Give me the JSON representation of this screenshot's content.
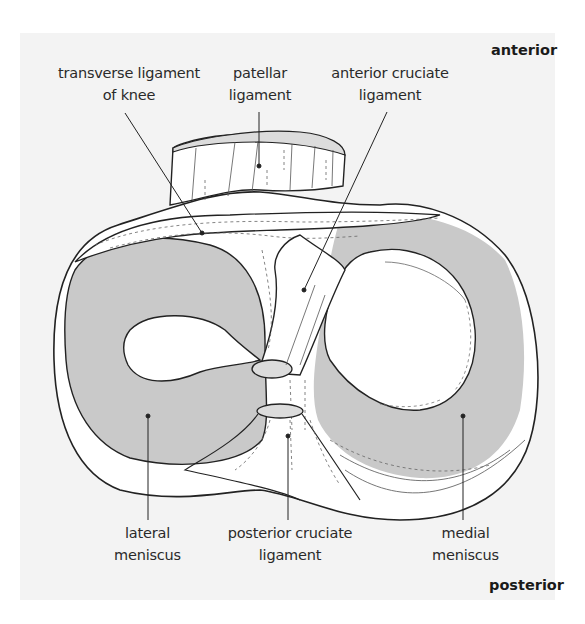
{
  "figure": {
    "orientation": {
      "top": "anterior",
      "bottom": "posterior"
    },
    "labels": {
      "transverse_ligament": {
        "line1": "transverse ligament",
        "line2": "of knee"
      },
      "patellar_ligament": {
        "line1": "patellar",
        "line2": "ligament"
      },
      "anterior_cruciate": {
        "line1": "anterior cruciate",
        "line2": "ligament"
      },
      "lateral_meniscus": {
        "line1": "lateral",
        "line2": "meniscus"
      },
      "posterior_cruciate": {
        "line1": "posterior cruciate",
        "line2": "ligament"
      },
      "medial_meniscus": {
        "line1": "medial",
        "line2": "meniscus"
      }
    },
    "colors": {
      "panel_background": "#f3f3f3",
      "meniscus_fill": "#c9c9c9",
      "tissue_fill": "#ffffff",
      "outline": "#222222",
      "ligament_end_fill": "#dcdcdc"
    }
  }
}
